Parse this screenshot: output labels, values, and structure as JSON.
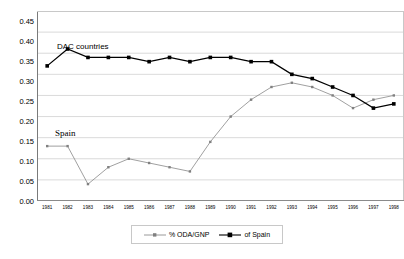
{
  "chart_data": {
    "type": "line",
    "title": "",
    "xlabel": "",
    "ylabel": "",
    "ylim": [
      0.0,
      0.45
    ],
    "ytick_step": 0.05,
    "grid": true,
    "legend_position": "bottom",
    "categories": [
      "1981",
      "1982",
      "1983",
      "1984",
      "1985",
      "1986",
      "1987",
      "1988",
      "1989",
      "1990",
      "1991",
      "1992",
      "1993",
      "1994",
      "1995",
      "1996",
      "1997",
      "1998"
    ],
    "yticks": [
      "0.00",
      "0.05",
      "0.10",
      "0.15",
      "0.20",
      "0.25",
      "0.30",
      "0.35",
      "0.40",
      "0.45"
    ],
    "series": [
      {
        "name": "of Spain",
        "color": "#000000",
        "marker": "filled-diamond",
        "values": [
          0.32,
          0.36,
          0.34,
          0.34,
          0.34,
          0.33,
          0.34,
          0.33,
          0.34,
          0.34,
          0.33,
          0.33,
          0.3,
          0.29,
          0.27,
          0.25,
          0.22,
          0.23
        ]
      },
      {
        "name": "% ODA/GNP",
        "color": "#808080",
        "marker": "small-square",
        "values": [
          0.13,
          0.13,
          0.04,
          0.08,
          0.1,
          0.09,
          0.08,
          0.07,
          0.14,
          0.2,
          0.24,
          0.27,
          0.28,
          0.27,
          0.25,
          0.22,
          0.24,
          0.25
        ]
      }
    ],
    "annotations": [
      {
        "text": "DAC countries",
        "x": "1982",
        "y": 0.385
      },
      {
        "text": "Spain",
        "x": "1981",
        "y": 0.165
      }
    ],
    "legend": [
      {
        "label": "% ODA/GNP",
        "color": "#808080"
      },
      {
        "label": "of Spain",
        "color": "#000000"
      }
    ]
  }
}
